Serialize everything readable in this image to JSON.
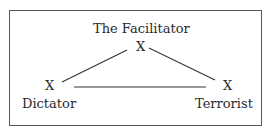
{
  "diagram": {
    "nodes": [
      {
        "id": "facilitator",
        "label": "The Facilitator",
        "marker": "X"
      },
      {
        "id": "dictator",
        "label": "Dictator",
        "marker": "X"
      },
      {
        "id": "terrorist",
        "label": "Terrorist",
        "marker": "X"
      }
    ],
    "edges": [
      {
        "from": "facilitator",
        "to": "dictator"
      },
      {
        "from": "facilitator",
        "to": "terrorist"
      },
      {
        "from": "dictator",
        "to": "terrorist"
      }
    ],
    "colors": {
      "line": "#333333",
      "border": "#555555",
      "text": "#2a2a2a"
    }
  }
}
